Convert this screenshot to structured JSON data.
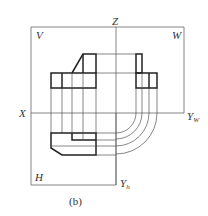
{
  "figure": {
    "caption": "(b)"
  },
  "labels": {
    "z": "Z",
    "v": "V",
    "w": "W",
    "x": "X",
    "yw": "Y",
    "yw_sub": "W",
    "h": "H",
    "yh": "Y",
    "yh_sub": "h"
  },
  "colors": {
    "line": "#222222",
    "thin_line": "#555555",
    "background": "#ffffff"
  }
}
